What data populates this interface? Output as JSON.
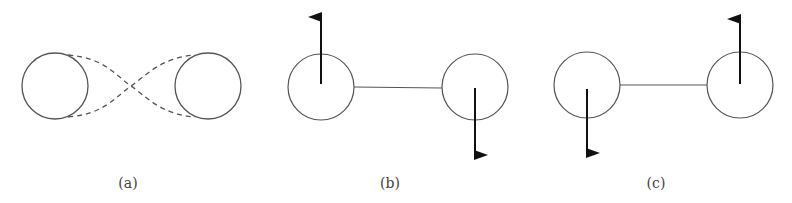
{
  "figure": {
    "panels": [
      {
        "id": "a",
        "caption": "(a)",
        "caption_x": 128,
        "circles": [
          {
            "cx": 55,
            "cy": 86,
            "r": 33
          },
          {
            "cx": 208,
            "cy": 86,
            "r": 33
          }
        ],
        "connection": "dashed-crossing-curves",
        "arrows": []
      },
      {
        "id": "b",
        "caption": "(b)",
        "caption_x": 390,
        "circles": [
          {
            "cx": 321,
            "cy": 87,
            "r": 33
          },
          {
            "cx": 475,
            "cy": 87,
            "r": 33
          }
        ],
        "connection": "solid-line",
        "arrows": [
          {
            "direction": "up",
            "x": 321,
            "from_y": 84,
            "to_y": 17
          },
          {
            "direction": "down",
            "x": 475,
            "from_y": 88,
            "to_y": 155
          }
        ]
      },
      {
        "id": "c",
        "caption": "(c)",
        "caption_x": 656,
        "circles": [
          {
            "cx": 587,
            "cy": 85,
            "r": 33
          },
          {
            "cx": 740,
            "cy": 85,
            "r": 33
          }
        ],
        "connection": "solid-line",
        "arrows": [
          {
            "direction": "down",
            "x": 587,
            "from_y": 89,
            "to_y": 153
          },
          {
            "direction": "up",
            "x": 740,
            "from_y": 84,
            "to_y": 19
          }
        ]
      }
    ],
    "colors": {
      "stroke": "#555555",
      "arrow": "#111111",
      "background": "#ffffff"
    }
  }
}
